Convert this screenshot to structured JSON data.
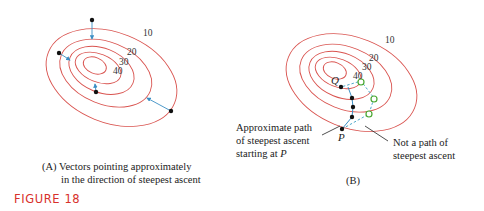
{
  "figure_label": "FIGURE 18",
  "colors": {
    "contour": "#d9534f",
    "arrow": "#3b8fc4",
    "path_dashed": "#3b9fc4",
    "open_point": "#4aa832",
    "figure_label": "#d8312b"
  },
  "panel_a": {
    "caption_line1": "(A) Vectors pointing approximately",
    "caption_line2": "in the direction of steepest ascent",
    "contour_labels": [
      "10",
      "20",
      "30",
      "40"
    ]
  },
  "panel_b": {
    "caption": "(B)",
    "contour_labels": [
      "10",
      "20",
      "30",
      "40"
    ],
    "point_q": "Q",
    "point_p": "P",
    "annotation_left": [
      "Approximate path",
      "of steepest ascent",
      "starting at "
    ],
    "annotation_left_italic": "P",
    "annotation_right": [
      "Not a path of",
      "steepest ascent"
    ]
  }
}
